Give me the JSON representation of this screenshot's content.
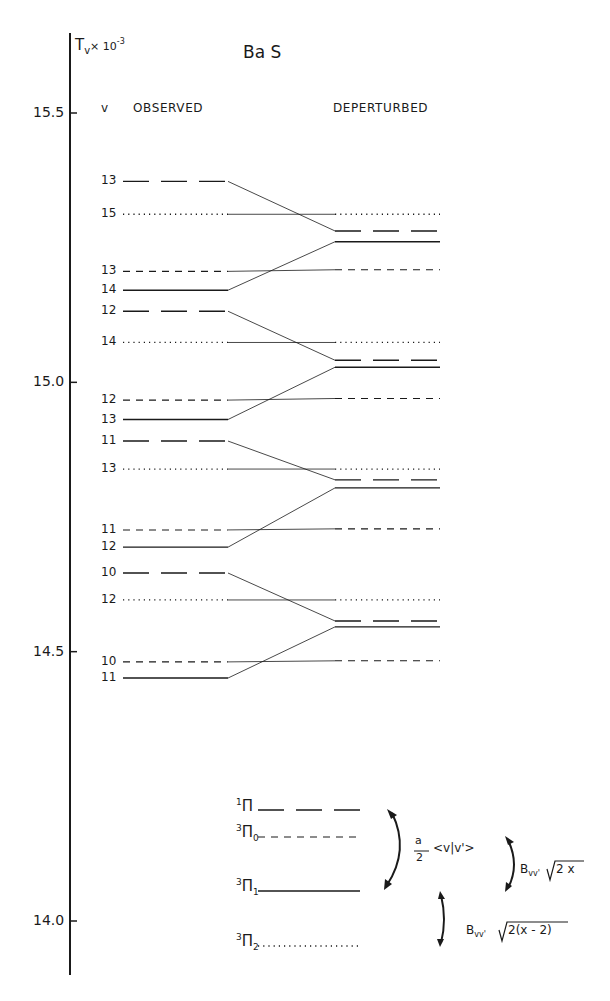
{
  "title": "Ba S",
  "axis": {
    "label_main": "T",
    "label_sub": "v",
    "label_suffix": "× 10",
    "label_exp": "-3",
    "ticks": [
      {
        "label": "15.5",
        "value": 15.5
      },
      {
        "label": "15.0",
        "value": 15.0
      },
      {
        "label": "14.5",
        "value": 14.5
      },
      {
        "label": "14.0",
        "value": 14.0
      }
    ]
  },
  "column_headers": {
    "v": "v",
    "observed": "OBSERVED",
    "deperturbed": "DEPERTURBED"
  },
  "legend": {
    "items": [
      {
        "sup": "1",
        "name": "Π",
        "sub": "",
        "style": "long-dash"
      },
      {
        "sup": "3",
        "name": "Π",
        "sub": "0",
        "style": "short-dash"
      },
      {
        "sup": "3",
        "name": "Π",
        "sub": "1",
        "style": "solid"
      },
      {
        "sup": "3",
        "name": "Π",
        "sub": "2",
        "style": "dotted"
      }
    ],
    "annotations": {
      "spin_orbit_num": "a",
      "spin_orbit_den": "2",
      "spin_orbit_bracket": "<v|v'>",
      "coupling_upper_prefix": "B",
      "coupling_upper_sub": "vv'",
      "coupling_upper_root": "2 x",
      "coupling_lower_prefix": "B",
      "coupling_lower_sub": "vv'",
      "coupling_lower_root": "2(x - 2)"
    }
  },
  "chart_data": {
    "type": "energy-level-diagram",
    "title": "Ba S",
    "ylabel": "T_v × 10^-3",
    "ylim": [
      13.9,
      15.6
    ],
    "yticks": [
      14.0,
      14.5,
      15.0,
      15.5
    ],
    "columns": [
      "OBSERVED",
      "DEPERTURBED"
    ],
    "groups": [
      {
        "levels": [
          {
            "state": "1Π",
            "v": 13,
            "observed": 15.373,
            "deperturbed": 15.281
          },
          {
            "state": "3Π2",
            "v": 15,
            "observed": 15.312,
            "deperturbed": 15.312
          },
          {
            "state": "3Π0",
            "v": 13,
            "observed": 15.206,
            "deperturbed": 15.209
          },
          {
            "state": "3Π1",
            "v": 14,
            "observed": 15.171,
            "deperturbed": 15.261
          }
        ]
      },
      {
        "levels": [
          {
            "state": "1Π",
            "v": 12,
            "observed": 15.132,
            "deperturbed": 15.041
          },
          {
            "state": "3Π2",
            "v": 14,
            "observed": 15.074,
            "deperturbed": 15.074
          },
          {
            "state": "3Π0",
            "v": 12,
            "observed": 14.967,
            "deperturbed": 14.97
          },
          {
            "state": "3Π1",
            "v": 13,
            "observed": 14.931,
            "deperturbed": 15.028
          }
        ]
      },
      {
        "levels": [
          {
            "state": "1Π",
            "v": 11,
            "observed": 14.891,
            "deperturbed": 14.819
          },
          {
            "state": "3Π2",
            "v": 13,
            "observed": 14.839,
            "deperturbed": 14.839
          },
          {
            "state": "3Π0",
            "v": 11,
            "observed": 14.726,
            "deperturbed": 14.728
          },
          {
            "state": "3Π1",
            "v": 12,
            "observed": 14.694,
            "deperturbed": 14.804
          }
        ]
      },
      {
        "levels": [
          {
            "state": "1Π",
            "v": 10,
            "observed": 14.646,
            "deperturbed": 14.557
          },
          {
            "state": "3Π2",
            "v": 12,
            "observed": 14.596,
            "deperturbed": 14.596
          },
          {
            "state": "3Π0",
            "v": 10,
            "observed": 14.481,
            "deperturbed": 14.483
          },
          {
            "state": "3Π1",
            "v": 11,
            "observed": 14.451,
            "deperturbed": 14.546
          }
        ]
      }
    ],
    "line_styles": {
      "1Π": "long-dash",
      "3Π0": "short-dash",
      "3Π1": "solid",
      "3Π2": "dotted"
    }
  }
}
